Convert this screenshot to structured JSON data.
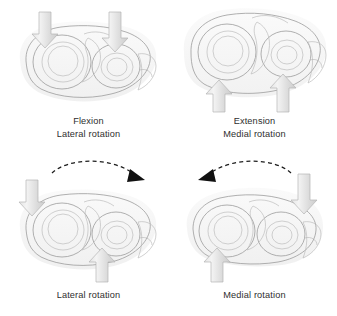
{
  "figure": {
    "background_color": "#ffffff",
    "panel_count": 4
  },
  "colors": {
    "background": "#ffffff",
    "text": "#2e2e2e",
    "bone_light": "#f2f2f2",
    "bone_mid": "#dedede",
    "bone_shadow": "#c4c4c4",
    "bone_outline": "#9c9c9c",
    "arrow_fill_light": "#ededed",
    "arrow_fill_mid": "#d6d6d6",
    "arrow_outline": "#b4b4b4",
    "rotation_arrow": "#111111"
  },
  "panels": [
    {
      "id": "top-left",
      "position": "top-left",
      "captions": [
        "Flexion",
        "Lateral rotation"
      ],
      "force_arrows": [
        {
          "name": "load-arrow-down-left",
          "direction": "down"
        },
        {
          "name": "load-arrow-down-right",
          "direction": "down"
        }
      ],
      "rotation_arrow": null
    },
    {
      "id": "top-right",
      "position": "top-right",
      "captions": [
        "Extension",
        "Medial rotation"
      ],
      "force_arrows": [
        {
          "name": "load-arrow-up-left",
          "direction": "up"
        },
        {
          "name": "load-arrow-up-right",
          "direction": "up"
        }
      ],
      "rotation_arrow": null
    },
    {
      "id": "bottom-left",
      "position": "bottom-left",
      "captions": [
        "Lateral rotation"
      ],
      "force_arrows": [
        {
          "name": "load-arrow-down-left",
          "direction": "down"
        },
        {
          "name": "load-arrow-up-center",
          "direction": "up"
        }
      ],
      "rotation_arrow": {
        "name": "rotation-arc-clockwise",
        "direction": "clockwise",
        "style": "dashed"
      }
    },
    {
      "id": "bottom-right",
      "position": "bottom-right",
      "captions": [
        "Medial rotation"
      ],
      "force_arrows": [
        {
          "name": "load-arrow-down-right",
          "direction": "down"
        },
        {
          "name": "load-arrow-up-center",
          "direction": "up"
        }
      ],
      "rotation_arrow": {
        "name": "rotation-arc-counterclockwise",
        "direction": "counterclockwise",
        "style": "dashed"
      }
    }
  ],
  "captions": {
    "top_left_line1": "Flexion",
    "top_left_line2": "Lateral rotation",
    "top_right_line1": "Extension",
    "top_right_line2": "Medial rotation",
    "bottom_left_line1": "Lateral rotation",
    "bottom_right_line1": "Medial rotation"
  }
}
